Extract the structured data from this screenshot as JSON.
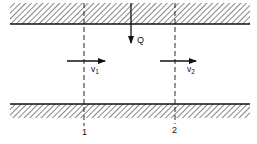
{
  "diagram": {
    "walls": {
      "top": {
        "x1": 10,
        "x2": 250,
        "y_hatch_top": 3,
        "y_edge": 24
      },
      "bottom": {
        "x1": 10,
        "x2": 250,
        "y_edge": 104,
        "y_hatch_bottom": 118
      }
    },
    "sections": [
      {
        "id": "1",
        "label": "1",
        "x": 84,
        "label_y": 135
      },
      {
        "id": "2",
        "label": "2",
        "x": 175,
        "label_y": 133
      }
    ],
    "inflow": {
      "label": "Q",
      "x": 131,
      "y_start": 3,
      "y_end": 43
    },
    "velocities": [
      {
        "label": "v",
        "subscript": "1",
        "x_start": 67,
        "x_end": 105,
        "y": 61,
        "label_x": 92,
        "label_y": 71
      },
      {
        "label": "v",
        "subscript": "2",
        "x_start": 160,
        "x_end": 196,
        "y": 61,
        "label_x": 188,
        "label_y": 71
      }
    ],
    "colors": {
      "line": "#111111",
      "background": "#ffffff"
    }
  }
}
